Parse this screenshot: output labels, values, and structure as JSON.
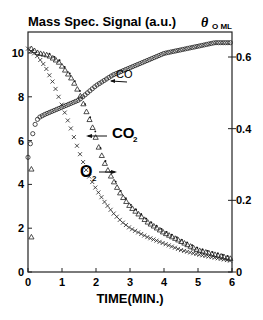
{
  "chart_data": {
    "type": "scatter",
    "title": "Mass Spec. Signal (a.u.)",
    "xlabel": "TIME(MIN.)",
    "ylabel": "Mass Spec. Signal (a.u.)",
    "ylabel_right": "θO ML",
    "xlim": [
      0,
      6
    ],
    "ylim": [
      0,
      10.8
    ],
    "ylim_right": [
      0,
      0.648
    ],
    "x_ticks": [
      "0",
      "1",
      "2",
      "3",
      "4",
      "5",
      "6"
    ],
    "y_ticks": [
      "0",
      "2",
      "4",
      "6",
      "8",
      "10"
    ],
    "y_ticks_right": [
      "0",
      "0.2",
      "0.4",
      "0.6"
    ],
    "grid": false,
    "legend": "inline annotations with arrows",
    "annotations": [
      {
        "text": "CO",
        "points_to": "CO coverage curve"
      },
      {
        "text": "CO2",
        "points_to": "CO2 signal curve"
      },
      {
        "text": "O2",
        "points_to": "O2 signal curve"
      }
    ],
    "series": [
      {
        "name": "O2",
        "marker": "x",
        "axis": "left",
        "x": [
          0,
          0.25,
          0.5,
          0.75,
          1.0,
          1.25,
          1.5,
          1.75,
          2.0,
          2.25,
          2.5,
          2.75,
          3.0,
          3.5,
          4.0,
          4.5,
          5.0,
          5.5,
          6.0
        ],
        "values": [
          10.2,
          9.9,
          9.4,
          8.6,
          7.6,
          6.6,
          5.5,
          4.5,
          3.8,
          3.2,
          2.7,
          2.3,
          2.0,
          1.6,
          1.3,
          1.0,
          0.8,
          0.65,
          0.5
        ]
      },
      {
        "name": "CO2",
        "marker": "triangle",
        "axis": "left",
        "x": [
          0.1,
          0.3,
          0.6,
          0.9,
          1.1,
          1.3,
          1.5,
          1.7,
          1.9,
          2.1,
          2.3,
          2.5,
          2.75,
          3.0,
          3.5,
          4.0,
          4.5,
          5.0,
          5.5,
          6.0
        ],
        "values": [
          10.2,
          10.0,
          9.9,
          9.6,
          9.2,
          8.8,
          8.2,
          7.4,
          6.6,
          5.6,
          4.8,
          4.2,
          3.5,
          3.0,
          2.3,
          1.8,
          1.4,
          1.0,
          0.8,
          0.6
        ]
      },
      {
        "name": "CO2 (early points)",
        "marker": "triangle",
        "axis": "left",
        "x": [
          0.1,
          0.1
        ],
        "values": [
          4.7,
          1.6
        ]
      },
      {
        "name": "CO coverage (θCO)",
        "marker": "circle",
        "axis": "right",
        "x": [
          0.0,
          0.05,
          0.1,
          0.15,
          0.2,
          0.3,
          0.5,
          0.75,
          1.0,
          1.25,
          1.5,
          1.75,
          2.0,
          2.5,
          3.0,
          3.5,
          4.0,
          4.5,
          5.0,
          5.5,
          6.0
        ],
        "values": [
          0.32,
          0.35,
          0.37,
          0.39,
          0.41,
          0.43,
          0.44,
          0.45,
          0.46,
          0.47,
          0.48,
          0.5,
          0.52,
          0.55,
          0.57,
          0.59,
          0.61,
          0.62,
          0.63,
          0.64,
          0.64
        ]
      }
    ]
  }
}
